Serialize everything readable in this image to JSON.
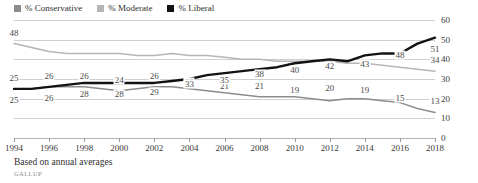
{
  "chart_data": {
    "type": "line",
    "title": "",
    "xlabel": "",
    "ylabel": "",
    "ylim": [
      0,
      60
    ],
    "ytick_step": 10,
    "yticks": [
      0,
      10,
      20,
      30,
      40,
      50,
      60
    ],
    "grid": true,
    "legend_position": "top-left",
    "xlim": [
      1994,
      2018
    ],
    "xtick_step": 2,
    "xticks": [
      1994,
      1996,
      1998,
      2000,
      2002,
      2004,
      2006,
      2008,
      2010,
      2012,
      2014,
      2016,
      2018
    ],
    "x": [
      1994,
      1995,
      1996,
      1997,
      1998,
      1999,
      2000,
      2001,
      2002,
      2003,
      2004,
      2005,
      2006,
      2007,
      2008,
      2009,
      2010,
      2011,
      2012,
      2013,
      2014,
      2015,
      2016,
      2017,
      2018
    ],
    "series": [
      {
        "name": "% Conservative",
        "color": "#8c8c8c",
        "values": [
          25,
          25,
          26,
          26,
          26,
          25,
          24,
          25,
          26,
          26,
          25,
          24,
          23,
          22,
          21,
          21,
          21,
          20,
          19,
          20,
          20,
          19,
          18,
          15,
          13
        ],
        "labeled_points": [
          {
            "x": 1994,
            "value": 25
          },
          {
            "x": 1996,
            "value": 26
          },
          {
            "x": 1998,
            "value": 26
          },
          {
            "x": 2000,
            "value": 24
          },
          {
            "x": 2002,
            "value": 26
          },
          {
            "x": 2004,
            "value": 23
          },
          {
            "x": 2006,
            "value": 21
          },
          {
            "x": 2008,
            "value": 21
          },
          {
            "x": 2010,
            "value": 19
          },
          {
            "x": 2012,
            "value": 20
          },
          {
            "x": 2014,
            "value": 19
          },
          {
            "x": 2016,
            "value": 15
          },
          {
            "x": 2018,
            "value": 13
          }
        ]
      },
      {
        "name": "% Moderate",
        "color": "#b5b5b5",
        "values": [
          48,
          46,
          44,
          43,
          43,
          43,
          43,
          42,
          42,
          43,
          42,
          42,
          41,
          40,
          40,
          39,
          39,
          39,
          39,
          38,
          38,
          37,
          36,
          35,
          34
        ],
        "labeled_points": [
          {
            "x": 1994,
            "value": 48
          },
          {
            "x": 2018,
            "value": 34
          }
        ]
      },
      {
        "name": "% Liberal",
        "color": "#121212",
        "values": [
          25,
          25,
          26,
          27,
          28,
          28,
          28,
          28,
          28,
          29,
          30,
          32,
          33,
          34,
          35,
          36,
          38,
          39,
          40,
          39,
          42,
          43,
          43,
          48,
          51
        ],
        "labeled_points": [
          {
            "x": 1994,
            "value": 25
          },
          {
            "x": 1996,
            "value": 26
          },
          {
            "x": 1998,
            "value": 28
          },
          {
            "x": 2000,
            "value": 28
          },
          {
            "x": 2002,
            "value": 29
          },
          {
            "x": 2004,
            "value": 33
          },
          {
            "x": 2006,
            "value": 35
          },
          {
            "x": 2008,
            "value": 38
          },
          {
            "x": 2010,
            "value": 40
          },
          {
            "x": 2012,
            "value": 42
          },
          {
            "x": 2014,
            "value": 43
          },
          {
            "x": 2016,
            "value": 48
          },
          {
            "x": 2018,
            "value": 51
          }
        ]
      }
    ]
  },
  "legend": {
    "items": [
      {
        "label": "% Conservative",
        "color": "#8c8c8c"
      },
      {
        "label": "% Moderate",
        "color": "#b5b5b5"
      },
      {
        "label": "% Liberal",
        "color": "#121212"
      }
    ]
  },
  "footer": {
    "note": "Based on annual averages",
    "source": "GALLUP"
  }
}
